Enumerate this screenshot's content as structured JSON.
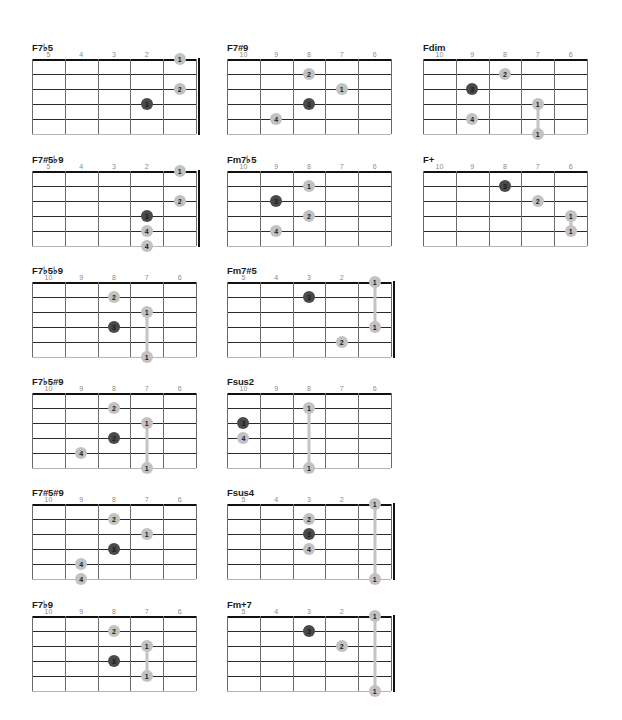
{
  "colors": {
    "dot_light": "#c2c2c2",
    "dot_dark": "#4a4a4a",
    "line": "#2b2b2b",
    "label": "#8a8a8a"
  },
  "chords": [
    {
      "name": "F7♭5",
      "pos": [
        32,
        42
      ],
      "frets": [
        "5",
        "4",
        "3",
        "2"
      ],
      "nut": true,
      "dots": [
        {
          "c": 4,
          "s": 0,
          "f": "1"
        },
        {
          "c": 4,
          "s": 2,
          "f": "2"
        },
        {
          "c": 3,
          "s": 3,
          "f": "3",
          "dark": true
        }
      ],
      "barres": []
    },
    {
      "name": "F7#9",
      "pos": [
        227,
        42
      ],
      "frets": [
        "10",
        "9",
        "8",
        "7",
        "6"
      ],
      "nut": false,
      "dots": [
        {
          "c": 2,
          "s": 1,
          "f": "2"
        },
        {
          "c": 3,
          "s": 2,
          "f": "1"
        },
        {
          "c": 2,
          "s": 3,
          "f": "3",
          "dark": true
        },
        {
          "c": 1,
          "s": 4,
          "f": "4"
        }
      ],
      "barres": []
    },
    {
      "name": "Fdim",
      "pos": [
        423,
        42
      ],
      "frets": [
        "10",
        "9",
        "8",
        "7",
        "6"
      ],
      "nut": false,
      "dots": [
        {
          "c": 2,
          "s": 1,
          "f": "2"
        },
        {
          "c": 1,
          "s": 2,
          "f": "3",
          "dark": true
        },
        {
          "c": 3,
          "s": 3,
          "f": "1"
        },
        {
          "c": 1,
          "s": 4,
          "f": "4"
        },
        {
          "c": 3,
          "s": 5,
          "f": "1"
        }
      ],
      "barres": [
        {
          "c": 3,
          "from": 3,
          "to": 5
        }
      ]
    },
    {
      "name": "F7#5♭9",
      "pos": [
        32,
        154
      ],
      "frets": [
        "5",
        "4",
        "3",
        "2"
      ],
      "nut": true,
      "dots": [
        {
          "c": 4,
          "s": 0,
          "f": "1"
        },
        {
          "c": 4,
          "s": 2,
          "f": "2"
        },
        {
          "c": 3,
          "s": 3,
          "f": "3",
          "dark": true
        },
        {
          "c": 3,
          "s": 4,
          "f": "4"
        },
        {
          "c": 3,
          "s": 5,
          "f": "4"
        }
      ],
      "barres": []
    },
    {
      "name": "Fm7♭5",
      "pos": [
        227,
        154
      ],
      "frets": [
        "10",
        "9",
        "8",
        "7",
        "6"
      ],
      "nut": false,
      "dots": [
        {
          "c": 2,
          "s": 1,
          "f": "1"
        },
        {
          "c": 1,
          "s": 2,
          "f": "3",
          "dark": true
        },
        {
          "c": 2,
          "s": 3,
          "f": "2"
        },
        {
          "c": 1,
          "s": 4,
          "f": "4"
        }
      ],
      "barres": []
    },
    {
      "name": "F+",
      "pos": [
        423,
        154
      ],
      "frets": [
        "10",
        "9",
        "8",
        "7",
        "6"
      ],
      "nut": false,
      "dots": [
        {
          "c": 2,
          "s": 1,
          "f": "3",
          "dark": true
        },
        {
          "c": 3,
          "s": 2,
          "f": "2"
        },
        {
          "c": 4,
          "s": 3,
          "f": "1"
        },
        {
          "c": 4,
          "s": 4,
          "f": "1"
        }
      ],
      "barres": [
        {
          "c": 4,
          "from": 3,
          "to": 4
        }
      ]
    },
    {
      "name": "F7♭5♭9",
      "pos": [
        32,
        265
      ],
      "frets": [
        "10",
        "9",
        "8",
        "7",
        "6"
      ],
      "nut": false,
      "dots": [
        {
          "c": 2,
          "s": 1,
          "f": "2"
        },
        {
          "c": 3,
          "s": 2,
          "f": "1"
        },
        {
          "c": 2,
          "s": 3,
          "f": "3",
          "dark": true
        },
        {
          "c": 3,
          "s": 5,
          "f": "1"
        }
      ],
      "barres": [
        {
          "c": 3,
          "from": 2,
          "to": 5
        }
      ]
    },
    {
      "name": "Fm7#5",
      "pos": [
        227,
        265
      ],
      "frets": [
        "5",
        "4",
        "3",
        "2"
      ],
      "nut": true,
      "dots": [
        {
          "c": 4,
          "s": 0,
          "f": "1"
        },
        {
          "c": 2,
          "s": 1,
          "f": "3",
          "dark": true
        },
        {
          "c": 4,
          "s": 3,
          "f": "1"
        },
        {
          "c": 3,
          "s": 4,
          "f": "2"
        }
      ],
      "barres": [
        {
          "c": 4,
          "from": 0,
          "to": 3
        }
      ]
    },
    {
      "name": "F7♭5#9",
      "pos": [
        32,
        376
      ],
      "frets": [
        "10",
        "9",
        "8",
        "7",
        "6"
      ],
      "nut": false,
      "dots": [
        {
          "c": 2,
          "s": 1,
          "f": "2"
        },
        {
          "c": 3,
          "s": 2,
          "f": "1"
        },
        {
          "c": 2,
          "s": 3,
          "f": "3",
          "dark": true
        },
        {
          "c": 1,
          "s": 4,
          "f": "4"
        },
        {
          "c": 3,
          "s": 5,
          "f": "1"
        }
      ],
      "barres": [
        {
          "c": 3,
          "from": 2,
          "to": 5
        }
      ]
    },
    {
      "name": "Fsus2",
      "pos": [
        227,
        376
      ],
      "frets": [
        "10",
        "9",
        "8",
        "7",
        "6"
      ],
      "nut": false,
      "dots": [
        {
          "c": 2,
          "s": 1,
          "f": "1"
        },
        {
          "c": 0,
          "s": 2,
          "f": "3",
          "dark": true
        },
        {
          "c": 0,
          "s": 3,
          "f": "4"
        },
        {
          "c": 2,
          "s": 5,
          "f": "1"
        }
      ],
      "barres": [
        {
          "c": 2,
          "from": 1,
          "to": 5
        }
      ]
    },
    {
      "name": "F7#5#9",
      "pos": [
        32,
        487
      ],
      "frets": [
        "10",
        "9",
        "8",
        "7",
        "6"
      ],
      "nut": false,
      "dots": [
        {
          "c": 2,
          "s": 1,
          "f": "2"
        },
        {
          "c": 3,
          "s": 2,
          "f": "1"
        },
        {
          "c": 2,
          "s": 3,
          "f": "3",
          "dark": true
        },
        {
          "c": 1,
          "s": 4,
          "f": "4"
        },
        {
          "c": 1,
          "s": 5,
          "f": "4"
        }
      ],
      "barres": []
    },
    {
      "name": "Fsus4",
      "pos": [
        227,
        487
      ],
      "frets": [
        "5",
        "4",
        "3",
        "2"
      ],
      "nut": true,
      "dots": [
        {
          "c": 4,
          "s": 0,
          "f": "1"
        },
        {
          "c": 2,
          "s": 1,
          "f": "2"
        },
        {
          "c": 2,
          "s": 2,
          "f": "3",
          "dark": true
        },
        {
          "c": 2,
          "s": 3,
          "f": "4"
        },
        {
          "c": 4,
          "s": 5,
          "f": "1"
        }
      ],
      "barres": [
        {
          "c": 4,
          "from": 0,
          "to": 5
        }
      ]
    },
    {
      "name": "F7♭9",
      "pos": [
        32,
        599
      ],
      "frets": [
        "10",
        "9",
        "8",
        "7",
        "6"
      ],
      "nut": false,
      "dots": [
        {
          "c": 2,
          "s": 1,
          "f": "2"
        },
        {
          "c": 3,
          "s": 2,
          "f": "1"
        },
        {
          "c": 2,
          "s": 3,
          "f": "3",
          "dark": true
        },
        {
          "c": 3,
          "s": 4,
          "f": "1"
        }
      ],
      "barres": [
        {
          "c": 3,
          "from": 2,
          "to": 4
        }
      ]
    },
    {
      "name": "Fm+7",
      "pos": [
        227,
        599
      ],
      "frets": [
        "5",
        "4",
        "3",
        "2"
      ],
      "nut": true,
      "dots": [
        {
          "c": 4,
          "s": 0,
          "f": "1"
        },
        {
          "c": 2,
          "s": 1,
          "f": "3",
          "dark": true
        },
        {
          "c": 3,
          "s": 2,
          "f": "2"
        },
        {
          "c": 4,
          "s": 5,
          "f": "1"
        }
      ],
      "barres": [
        {
          "c": 4,
          "from": 0,
          "to": 5
        }
      ]
    }
  ]
}
